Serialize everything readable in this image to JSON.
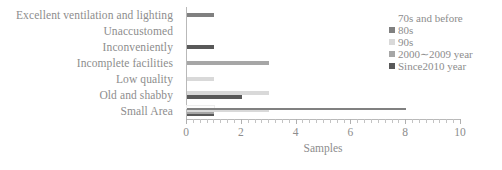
{
  "chart_data": {
    "type": "bar",
    "orientation": "horizontal",
    "title": "",
    "xlabel": "Samples",
    "ylabel": "",
    "xlim": [
      0,
      10
    ],
    "xticks": [
      0,
      2,
      4,
      6,
      8,
      10
    ],
    "xtick_labels": [
      "0",
      "2",
      "4",
      "6",
      "8",
      "10"
    ],
    "grid": false,
    "legend_position": "top-right",
    "categories": [
      "Excellent ventilation and lighting",
      "Unaccustomed",
      "Inconveniently",
      "Incomplete facilities",
      "Low quality",
      "Old and shabby",
      "Small Area"
    ],
    "series": [
      {
        "name": "70s and before",
        "color": "#fdfdfd",
        "values": [
          0,
          0,
          0,
          0,
          0,
          0,
          1
        ]
      },
      {
        "name": "80s",
        "color": "#808080",
        "values": [
          1,
          0,
          0,
          0,
          0,
          0,
          8
        ]
      },
      {
        "name": "90s",
        "color": "#d9d9d9",
        "values": [
          0,
          0,
          0,
          0,
          1,
          3,
          3
        ]
      },
      {
        "name": "2000∼2009 year",
        "color": "#a6a6a6",
        "values": [
          0,
          0,
          0,
          3,
          0,
          0,
          1
        ]
      },
      {
        "name": "Since2010 year",
        "color": "#595959",
        "values": [
          0,
          0,
          1,
          0,
          0,
          2,
          1
        ]
      }
    ]
  },
  "colors": {
    "axis": "#b9b9b9",
    "text": "#8d8d8d",
    "background": "#ffffff"
  }
}
